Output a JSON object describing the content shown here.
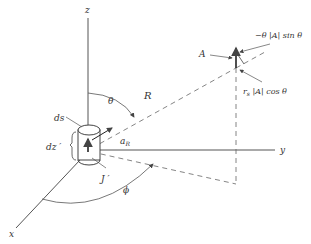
{
  "diagram": {
    "type": "3D coordinate geometry (vector potential of current element)",
    "axes": {
      "x": "x",
      "y": "y",
      "z": "z"
    },
    "labels": {
      "theta": "θ",
      "phi": "ϕ",
      "R": "R",
      "ds": "ds",
      "dz": "dz ′",
      "J": "J ′",
      "aR": "a",
      "aR_sub": "R",
      "A": "A",
      "theta_component": "−θ |A| sin θ",
      "r_component": "r",
      "r_sub": "s",
      "r_component_rest": " |A| cos θ"
    },
    "colors": {
      "line": "#555555",
      "text": "#333333",
      "background": "#ffffff"
    }
  }
}
